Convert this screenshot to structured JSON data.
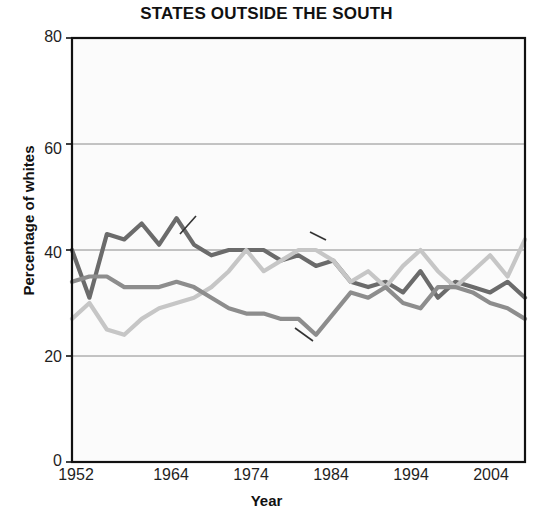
{
  "chart_data": {
    "type": "line",
    "title": "STATES OUTSIDE THE SOUTH",
    "xlabel": "Year",
    "ylabel": "Percentage of whites",
    "ylim": [
      0,
      80
    ],
    "xlim": [
      1952,
      2004
    ],
    "yticks": [
      "0",
      "20",
      "40",
      "60",
      "80"
    ],
    "ytick_values": [
      0,
      20,
      40,
      60,
      80
    ],
    "xticks": [
      "1952",
      "1964",
      "1974",
      "1984",
      "1994",
      "2004"
    ],
    "xtick_values": [
      1952,
      1964,
      1974,
      1984,
      1994,
      2004
    ],
    "grid": "horizontal",
    "legend_position": "inline-annotations",
    "x": [
      1952,
      1954,
      1956,
      1958,
      1960,
      1962,
      1964,
      1966,
      1968,
      1970,
      1972,
      1974,
      1976,
      1978,
      1980,
      1982,
      1984,
      1986,
      1988,
      1990,
      1992,
      1994,
      1996,
      1998,
      2000,
      2002,
      2004
    ],
    "series": [
      {
        "name": "Democrats",
        "color": "#6b6b6b",
        "values": [
          40,
          31,
          43,
          42,
          45,
          41,
          46,
          41,
          39,
          40,
          40,
          40,
          38,
          39,
          37,
          38,
          34,
          33,
          34,
          32,
          36,
          31,
          34,
          33,
          32,
          34,
          31
        ]
      },
      {
        "name": "Independents",
        "color": "#c6c6c6",
        "values": [
          27,
          30,
          25,
          24,
          27,
          29,
          30,
          31,
          33,
          36,
          40,
          36,
          38,
          40,
          40,
          38,
          34,
          36,
          33,
          37,
          40,
          36,
          33,
          36,
          39,
          35,
          42
        ]
      },
      {
        "name": "Republicans",
        "color": "#8d8d8d",
        "values": [
          34,
          35,
          35,
          33,
          33,
          33,
          34,
          33,
          31,
          29,
          28,
          28,
          27,
          27,
          24,
          28,
          32,
          31,
          33,
          30,
          29,
          33,
          33,
          32,
          30,
          29,
          27
        ]
      }
    ],
    "annotations": [
      {
        "text": "Democrats",
        "series": "Democrats"
      },
      {
        "text": "Independents",
        "series": "Independents"
      },
      {
        "text": "Republicans",
        "series": "Republicans"
      }
    ]
  },
  "axis_titles": {
    "x": "Year",
    "y": "Percentage of whites"
  }
}
